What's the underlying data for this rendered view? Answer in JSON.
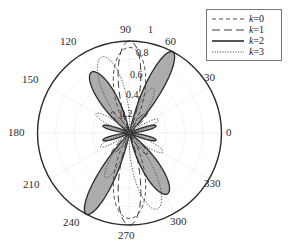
{
  "figure": {
    "type": "polar-plot",
    "background": "#ffffff"
  },
  "legend": {
    "position": "top-right",
    "border_color": "#777777",
    "entries": [
      {
        "label": "k=0",
        "symbol": "k",
        "value": "0",
        "style": "dashed-short",
        "color": "#4d4d4d",
        "dash": "5,3"
      },
      {
        "label": "k=1",
        "symbol": "k",
        "value": "1",
        "style": "dashed-long",
        "color": "#3a3a3a",
        "dash": "9,5"
      },
      {
        "label": "k=2",
        "symbol": "k",
        "value": "2",
        "style": "solid",
        "color": "#2b2b2b",
        "dash": "none"
      },
      {
        "label": "k=3",
        "symbol": "k",
        "value": "3",
        "style": "dotted",
        "color": "#555555",
        "dash": "1.5,1.5"
      }
    ]
  },
  "axes": {
    "angle_unit": "degrees",
    "angle_ticks": [
      "0",
      "30",
      "60",
      "90",
      "120",
      "150",
      "180",
      "210",
      "240",
      "270",
      "300",
      "330"
    ],
    "radial_ticks": [
      "0.2",
      "0.4",
      "0.6",
      "0.8",
      "1"
    ],
    "radial_label_angle_deg": 76,
    "grid_color": "#cccccc",
    "outline_color": "#2b2b2b",
    "rmax": 1
  },
  "chart_data": {
    "type": "line",
    "title": "",
    "xlabel": "",
    "ylabel": "",
    "projection": "polar",
    "angle_unit": "degrees",
    "rlim": [
      0,
      1
    ],
    "grid": true,
    "legend_position": "top-right",
    "theta_ticks_deg": [
      0,
      30,
      60,
      90,
      120,
      150,
      180,
      210,
      240,
      270,
      300,
      330
    ],
    "r_ticks": [
      0.2,
      0.4,
      0.6,
      0.8,
      1.0
    ],
    "fill_series": "k=2",
    "fill_color": "#8c8c8c",
    "series": [
      {
        "name": "k=0",
        "style": "dashed-short",
        "color": "#4d4d4d",
        "lobes": [
          {
            "center_deg": 90,
            "peak_r": 0.93,
            "half_width_deg": 34
          },
          {
            "center_deg": 270,
            "peak_r": 0.93,
            "half_width_deg": 34
          }
        ]
      },
      {
        "name": "k=1",
        "style": "dashed-long",
        "color": "#3a3a3a",
        "lobes": [
          {
            "center_deg": 90,
            "peak_r": 1.0,
            "half_width_deg": 22
          },
          {
            "center_deg": 270,
            "peak_r": 1.0,
            "half_width_deg": 22
          },
          {
            "center_deg": 130,
            "peak_r": 0.3,
            "half_width_deg": 14
          },
          {
            "center_deg": 50,
            "peak_r": 0.3,
            "half_width_deg": 14
          },
          {
            "center_deg": 230,
            "peak_r": 0.3,
            "half_width_deg": 14
          },
          {
            "center_deg": 310,
            "peak_r": 0.3,
            "half_width_deg": 14
          }
        ]
      },
      {
        "name": "k=2",
        "style": "solid",
        "color": "#2b2b2b",
        "lobes": [
          {
            "center_deg": 62,
            "peak_r": 1.0,
            "half_width_deg": 17
          },
          {
            "center_deg": 242,
            "peak_r": 1.0,
            "half_width_deg": 17
          },
          {
            "center_deg": 122,
            "peak_r": 0.78,
            "half_width_deg": 22
          },
          {
            "center_deg": 302,
            "peak_r": 0.78,
            "half_width_deg": 22
          },
          {
            "center_deg": 15,
            "peak_r": 0.3,
            "half_width_deg": 12
          },
          {
            "center_deg": 165,
            "peak_r": 0.3,
            "half_width_deg": 12
          },
          {
            "center_deg": 195,
            "peak_r": 0.3,
            "half_width_deg": 12
          },
          {
            "center_deg": 345,
            "peak_r": 0.3,
            "half_width_deg": 12
          }
        ]
      },
      {
        "name": "k=3",
        "style": "dotted",
        "color": "#555555",
        "lobes": [
          {
            "center_deg": 110,
            "peak_r": 0.88,
            "half_width_deg": 24
          },
          {
            "center_deg": 290,
            "peak_r": 0.88,
            "half_width_deg": 24
          },
          {
            "center_deg": 62,
            "peak_r": 0.55,
            "half_width_deg": 17
          },
          {
            "center_deg": 242,
            "peak_r": 0.55,
            "half_width_deg": 17
          },
          {
            "center_deg": 150,
            "peak_r": 0.42,
            "half_width_deg": 15
          },
          {
            "center_deg": 330,
            "peak_r": 0.42,
            "half_width_deg": 15
          },
          {
            "center_deg": 25,
            "peak_r": 0.35,
            "half_width_deg": 13
          },
          {
            "center_deg": 205,
            "peak_r": 0.35,
            "half_width_deg": 13
          }
        ]
      }
    ]
  },
  "angle_label_positions": [
    {
      "text": "0",
      "left": 226,
      "top": 127
    },
    {
      "text": "30",
      "left": 204,
      "top": 72
    },
    {
      "text": "60",
      "left": 165,
      "top": 36
    },
    {
      "text": "90",
      "left": 120,
      "top": 24
    },
    {
      "text": "120",
      "left": 60,
      "top": 36
    },
    {
      "text": "150",
      "left": 22,
      "top": 74
    },
    {
      "text": "180",
      "left": 8,
      "top": 127
    },
    {
      "text": "210",
      "left": 23,
      "top": 179
    },
    {
      "text": "240",
      "left": 63,
      "top": 217
    },
    {
      "text": "270",
      "left": 118,
      "top": 230
    },
    {
      "text": "300",
      "left": 170,
      "top": 216
    },
    {
      "text": "330",
      "left": 204,
      "top": 178
    }
  ],
  "radial_label_positions": [
    {
      "text": "1",
      "left": 148,
      "top": 25
    },
    {
      "text": "0.8",
      "left": 136,
      "top": 48
    },
    {
      "text": "0.6",
      "left": 130,
      "top": 70
    },
    {
      "text": "0.4",
      "left": 126,
      "top": 90
    },
    {
      "text": "0.2",
      "left": 120,
      "top": 109
    }
  ]
}
